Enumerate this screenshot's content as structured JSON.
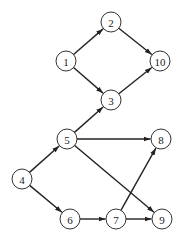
{
  "diagram": {
    "type": "directed-graph",
    "node_radius": 10,
    "colors": {
      "stroke": "#333333",
      "fill": "#ffffff",
      "edge": "#222222",
      "text": "#222222"
    },
    "nodes": [
      {
        "id": "1",
        "label": "1",
        "x": 66,
        "y": 61
      },
      {
        "id": "2",
        "label": "2",
        "x": 111,
        "y": 22
      },
      {
        "id": "3",
        "label": "3",
        "x": 111,
        "y": 100
      },
      {
        "id": "4",
        "label": "4",
        "x": 22,
        "y": 179
      },
      {
        "id": "5",
        "label": "5",
        "x": 67,
        "y": 139
      },
      {
        "id": "6",
        "label": "6",
        "x": 70,
        "y": 219
      },
      {
        "id": "7",
        "label": "7",
        "x": 116,
        "y": 219
      },
      {
        "id": "8",
        "label": "8",
        "x": 161,
        "y": 139
      },
      {
        "id": "9",
        "label": "9",
        "x": 162,
        "y": 219
      },
      {
        "id": "10",
        "label": "10",
        "x": 160,
        "y": 61
      }
    ],
    "edges": [
      {
        "from": "1",
        "to": "2"
      },
      {
        "from": "1",
        "to": "3"
      },
      {
        "from": "2",
        "to": "10"
      },
      {
        "from": "3",
        "to": "10"
      },
      {
        "from": "5",
        "to": "3"
      },
      {
        "from": "4",
        "to": "5"
      },
      {
        "from": "4",
        "to": "6"
      },
      {
        "from": "5",
        "to": "8"
      },
      {
        "from": "5",
        "to": "9"
      },
      {
        "from": "6",
        "to": "7"
      },
      {
        "from": "7",
        "to": "9"
      },
      {
        "from": "7",
        "to": "8"
      }
    ]
  }
}
